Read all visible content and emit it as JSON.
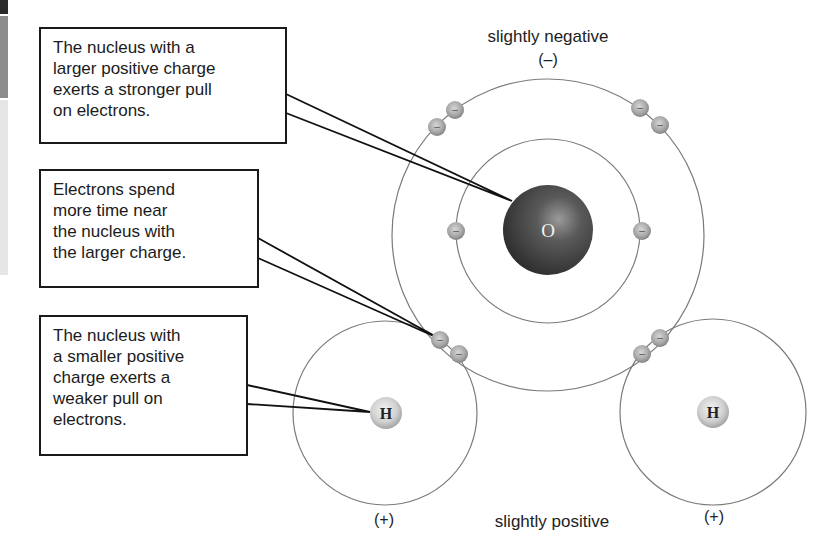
{
  "callouts": [
    {
      "id": "larger-charge",
      "lines": [
        "The nucleus with a",
        "larger positive charge",
        "exerts a stronger pull",
        "on electrons."
      ]
    },
    {
      "id": "electrons-time",
      "lines": [
        "Electrons spend",
        "more time near",
        "the nucleus with",
        "the larger charge."
      ]
    },
    {
      "id": "smaller-charge",
      "lines": [
        "The nucleus with",
        "a smaller positive",
        "charge exerts a",
        "weaker pull on",
        "electrons."
      ]
    }
  ],
  "labels": {
    "top_title": "slightly negative",
    "top_sign": "(–)",
    "bottom_title": "slightly positive",
    "left_sign": "(+)",
    "right_sign": "(+)"
  },
  "atoms": {
    "oxygen": {
      "symbol": "O"
    },
    "hydrogen_left": {
      "symbol": "H"
    },
    "hydrogen_right": {
      "symbol": "H"
    }
  },
  "electron_symbol": "–",
  "colors": {
    "oxygen_nucleus": "#3a3a3a",
    "hydrogen_nucleus": "#d8d8d8",
    "electron": "#a8a8a8",
    "orbit": "#7a7a7a",
    "leader": "#111111"
  }
}
